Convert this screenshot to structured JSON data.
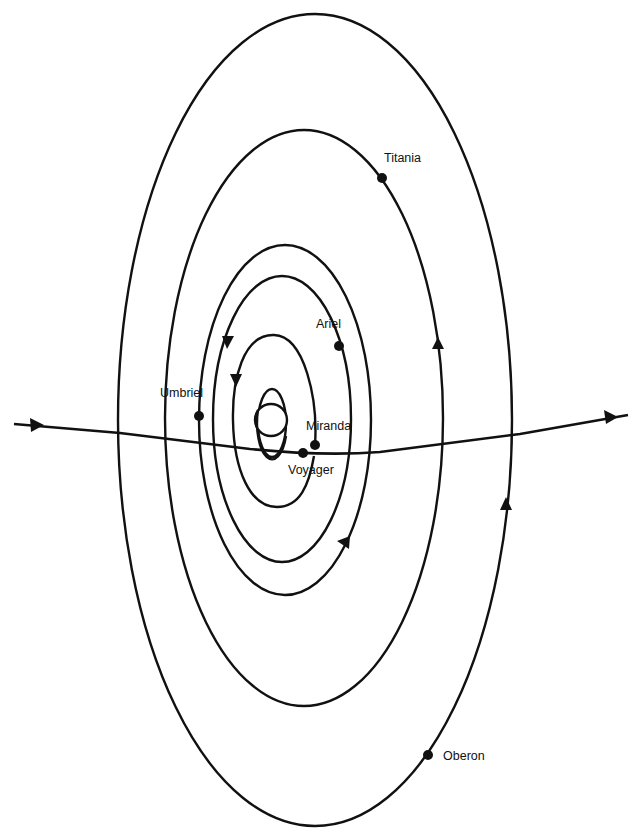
{
  "diagram": {
    "colors": {
      "line": "#111111",
      "background": "#ffffff"
    },
    "planet": {
      "name": "Uranus",
      "icon": "planet-with-ring-icon"
    },
    "trajectory": {
      "label": "Voyager",
      "direction": "left-to-right"
    },
    "moons": [
      {
        "name": "Miranda",
        "label": "Miranda"
      },
      {
        "name": "Ariel",
        "label": "Ariel"
      },
      {
        "name": "Umbriel",
        "label": "Umbriel"
      },
      {
        "name": "Titania",
        "label": "Titania"
      },
      {
        "name": "Oberon",
        "label": "Oberon"
      }
    ]
  }
}
